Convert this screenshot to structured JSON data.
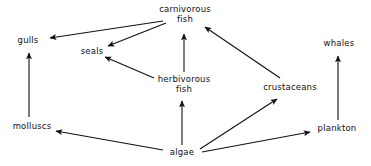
{
  "diagram": {
    "type": "food-web",
    "canvas": {
      "width": 371,
      "height": 166
    },
    "style": {
      "background": "#ffffff",
      "line_color": "#111111",
      "text_color": "#111111",
      "line_width": 1.1
    },
    "nodes": [
      {
        "id": "carnivorous_fish",
        "label": "carnivorous\nfish",
        "x": 185,
        "y": 14
      },
      {
        "id": "gulls",
        "label": "gulls",
        "x": 28,
        "y": 41
      },
      {
        "id": "seals",
        "label": "seals",
        "x": 92,
        "y": 52
      },
      {
        "id": "whales",
        "label": "whales",
        "x": 339,
        "y": 44
      },
      {
        "id": "herbivorous_fish",
        "label": "herbivorous\nfish",
        "x": 184,
        "y": 84
      },
      {
        "id": "crustaceans",
        "label": "crustaceans",
        "x": 290,
        "y": 88
      },
      {
        "id": "molluscs",
        "label": "molluscs",
        "x": 32,
        "y": 127
      },
      {
        "id": "plankton",
        "label": "plankton",
        "x": 337,
        "y": 129
      },
      {
        "id": "algae",
        "label": "algae",
        "x": 182,
        "y": 153
      }
    ],
    "edges": [
      {
        "id": "carnivorous-to-gulls",
        "from": "carnivorous_fish",
        "to": "gulls",
        "x1": 163,
        "y1": 21,
        "x2": 50,
        "y2": 38
      },
      {
        "id": "carnivorous-to-seals",
        "from": "carnivorous_fish",
        "to": "seals",
        "x1": 166,
        "y1": 23,
        "x2": 108,
        "y2": 46
      },
      {
        "id": "herbivorous-to-seals",
        "from": "herbivorous_fish",
        "to": "seals",
        "x1": 154,
        "y1": 78,
        "x2": 105,
        "y2": 57
      },
      {
        "id": "herbivorous-to-carnivorous",
        "from": "herbivorous_fish",
        "to": "carnivorous_fish",
        "x1": 184,
        "y1": 72,
        "x2": 184,
        "y2": 34
      },
      {
        "id": "crustaceans-to-carnivorous",
        "from": "crustaceans",
        "to": "carnivorous_fish",
        "x1": 280,
        "y1": 78,
        "x2": 205,
        "y2": 27
      },
      {
        "id": "molluscs-to-gulls",
        "from": "molluscs",
        "to": "gulls",
        "x1": 29,
        "y1": 117,
        "x2": 29,
        "y2": 53
      },
      {
        "id": "plankton-to-whales",
        "from": "plankton",
        "to": "whales",
        "x1": 338,
        "y1": 120,
        "x2": 338,
        "y2": 56
      },
      {
        "id": "algae-to-molluscs",
        "from": "algae",
        "to": "molluscs",
        "x1": 163,
        "y1": 150,
        "x2": 56,
        "y2": 131
      },
      {
        "id": "algae-to-herbivorous",
        "from": "algae",
        "to": "herbivorous_fish",
        "x1": 182,
        "y1": 145,
        "x2": 182,
        "y2": 101
      },
      {
        "id": "algae-to-crustaceans",
        "from": "algae",
        "to": "crustaceans",
        "x1": 200,
        "y1": 149,
        "x2": 277,
        "y2": 99
      },
      {
        "id": "algae-to-plankton",
        "from": "algae",
        "to": "plankton",
        "x1": 202,
        "y1": 152,
        "x2": 310,
        "y2": 132
      }
    ]
  }
}
